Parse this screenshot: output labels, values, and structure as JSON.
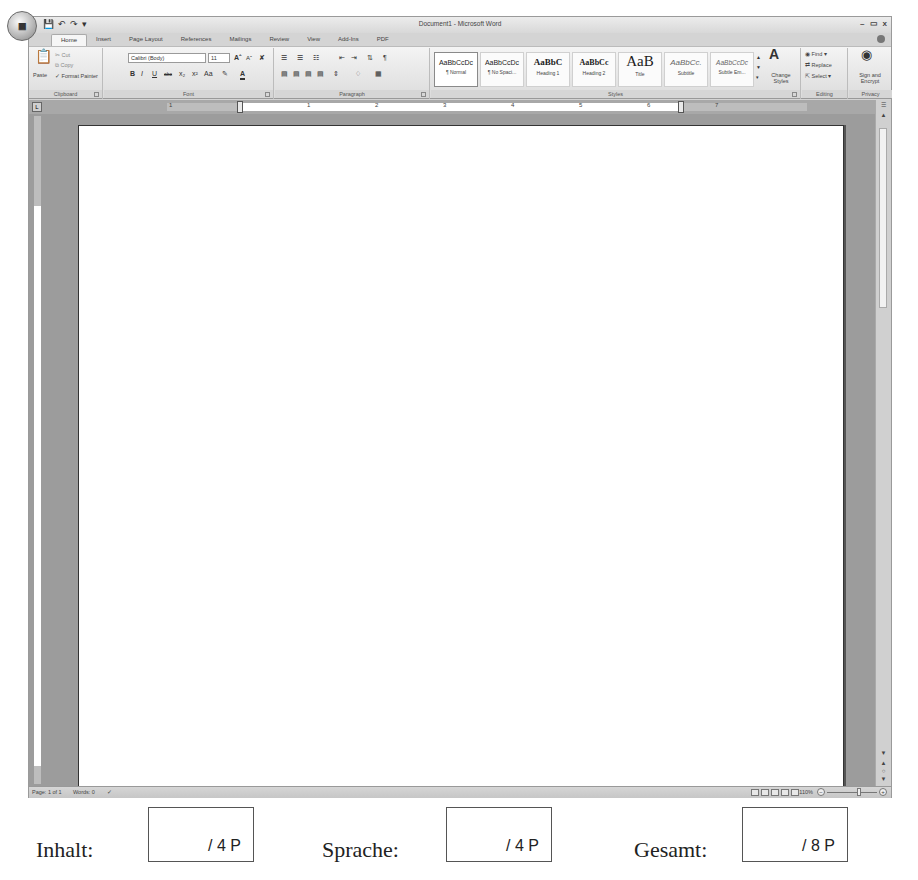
{
  "window": {
    "title": "Document1 - Microsoft Word",
    "office_button": "office-logo",
    "quick_access": [
      "save-icon",
      "undo-icon",
      "redo-icon",
      "customize-icon"
    ],
    "controls": [
      "–",
      "▭",
      "x"
    ]
  },
  "tabs": [
    {
      "label": "Home",
      "active": true
    },
    {
      "label": "Insert"
    },
    {
      "label": "Page Layout"
    },
    {
      "label": "References"
    },
    {
      "label": "Mailings"
    },
    {
      "label": "Review"
    },
    {
      "label": "View"
    },
    {
      "label": "Add-Ins"
    },
    {
      "label": "PDF"
    }
  ],
  "ribbon": {
    "clipboard": {
      "label": "Clipboard",
      "paste": "Paste",
      "cut": "Cut",
      "copy": "Copy",
      "format_painter": "Format Painter"
    },
    "font": {
      "label": "Font",
      "font_name": "Calibri (Body)",
      "font_size": "11",
      "buttons": [
        "B",
        "I",
        "U",
        "abc",
        "x₂",
        "x²",
        "Aa"
      ]
    },
    "paragraph": {
      "label": "Paragraph"
    },
    "styles": {
      "label": "Styles",
      "items": [
        {
          "sample": "AaBbCcDc",
          "name": "¶ Normal"
        },
        {
          "sample": "AaBbCcDc",
          "name": "¶ No Spaci..."
        },
        {
          "sample": "AaBbC",
          "name": "Heading 1"
        },
        {
          "sample": "AaBbCc",
          "name": "Heading 2"
        },
        {
          "sample": "AaB",
          "name": "Title"
        },
        {
          "sample": "AaBbCc.",
          "name": "Subtitle"
        },
        {
          "sample": "AaBbCcDc",
          "name": "Subtle Em..."
        }
      ],
      "change_styles": "Change Styles"
    },
    "editing": {
      "label": "Editing",
      "find": "Find",
      "replace": "Replace",
      "select": "Select"
    },
    "privacy": {
      "label": "Privacy",
      "sign_encrypt": "Sign and Encrypt"
    }
  },
  "ruler": {
    "numbers": [
      "1",
      "1",
      "2",
      "3",
      "4",
      "5",
      "6",
      "7"
    ]
  },
  "status_bar": {
    "page": "Page: 1 of 1",
    "words": "Words: 0",
    "zoom": "110%"
  },
  "scores": [
    {
      "label": "Inhalt:",
      "value": "/ 4 P"
    },
    {
      "label": "Sprache:",
      "value": "/ 4 P"
    },
    {
      "label": "Gesamt:",
      "value": "/ 8 P"
    }
  ]
}
